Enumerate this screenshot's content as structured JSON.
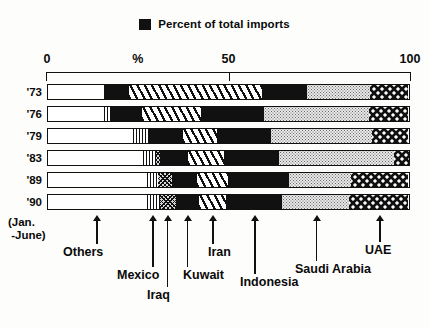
{
  "legend": {
    "swatch_icon": "black-square-icon",
    "label": "Percent of total imports"
  },
  "axis": {
    "ticks": [
      {
        "label": "0",
        "value": 0
      },
      {
        "label": "%",
        "value": 25
      },
      {
        "label": "50",
        "value": 50
      },
      {
        "label": "100",
        "value": 100
      }
    ]
  },
  "rows": [
    {
      "label": "'73"
    },
    {
      "label": "'76"
    },
    {
      "label": "'79"
    },
    {
      "label": "'83"
    },
    {
      "label": "'89"
    },
    {
      "label": "'90"
    }
  ],
  "subnote": "(Jan.\n -June)",
  "callouts": [
    {
      "label": "Others"
    },
    {
      "label": "Mexico"
    },
    {
      "label": "Iraq"
    },
    {
      "label": "Kuwait"
    },
    {
      "label": "Iran"
    },
    {
      "label": "Indonesia"
    },
    {
      "label": "Saudi Arabia"
    },
    {
      "label": "UAE"
    }
  ],
  "colors": {
    "ink": "#111111",
    "paper": "#fdfdfb",
    "saudi_fill": "#e9e9e9",
    "iraq_fill": "#d8d8d8"
  },
  "chart_data": {
    "type": "bar",
    "orientation": "horizontal",
    "stacked": true,
    "title": "Percent of total imports",
    "xlabel": "%",
    "ylabel": "",
    "xlim": [
      0,
      100
    ],
    "grid": false,
    "legend_position": "top-center",
    "categories": [
      "'73",
      "'76",
      "'79",
      "'83",
      "'89",
      "'90"
    ],
    "series": [
      {
        "name": "Others",
        "pattern": "solid-white",
        "values": [
          15.5,
          15.5,
          23.5,
          26.5,
          27.5,
          27.5
        ]
      },
      {
        "name": "Mexico",
        "pattern": "vertical-hatch",
        "values": [
          0.0,
          2.0,
          4.5,
          3.5,
          3.0,
          3.5
        ]
      },
      {
        "name": "Iraq",
        "pattern": "cross-hatch-grey",
        "values": [
          0.0,
          0.0,
          0.0,
          1.0,
          4.0,
          4.5
        ]
      },
      {
        "name": "Kuwait",
        "pattern": "solid-black",
        "values": [
          7.0,
          8.5,
          9.5,
          8.0,
          7.0,
          6.5
        ]
      },
      {
        "name": "Iran",
        "pattern": "diagonal-hatch",
        "values": [
          37.0,
          16.5,
          9.5,
          10.0,
          8.5,
          7.5
        ]
      },
      {
        "name": "Indonesia",
        "pattern": "solid-black",
        "values": [
          12.5,
          17.5,
          15.0,
          15.0,
          17.0,
          15.5
        ]
      },
      {
        "name": "Saudi Arabia",
        "pattern": "fine-dots",
        "values": [
          17.5,
          29.0,
          28.0,
          32.0,
          17.0,
          18.5
        ]
      },
      {
        "name": "UAE",
        "pattern": "checkerboard",
        "values": [
          10.5,
          11.0,
          10.0,
          11.5,
          16.0,
          16.5
        ]
      }
    ]
  }
}
